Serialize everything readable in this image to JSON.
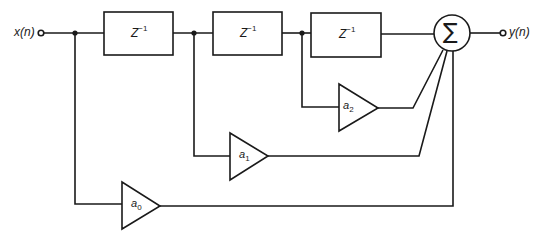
{
  "diagram": {
    "type": "FIR filter block diagram (direct form / tapped delay line)",
    "input": {
      "label": "x(n)"
    },
    "output": {
      "label": "y(n)"
    },
    "delays": [
      {
        "label": "Z",
        "exponent": "−1"
      },
      {
        "label": "Z",
        "exponent": "−1"
      },
      {
        "label": "Z",
        "exponent": "−1"
      }
    ],
    "gains": [
      {
        "label": "a",
        "subscript": "0"
      },
      {
        "label": "a",
        "subscript": "1"
      },
      {
        "label": "a",
        "subscript": "2"
      }
    ],
    "summer": {
      "symbol": "∑"
    },
    "colors": {
      "line": "#1a1a1a",
      "background": "#ffffff"
    }
  }
}
